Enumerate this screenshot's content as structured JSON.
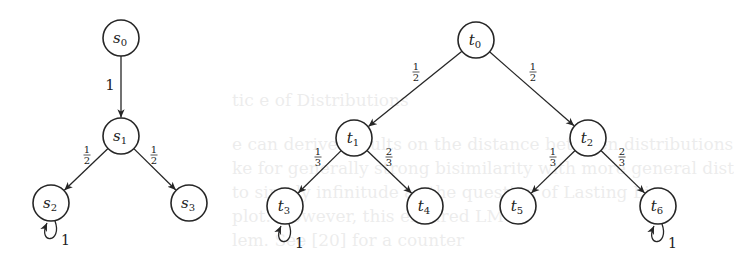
{
  "background_text": [
    {
      "text": "tic e of Distributions",
      "x": 232,
      "y": 104
    },
    {
      "text": "e can derive results on the distance between distributions",
      "x": 232,
      "y": 148
    },
    {
      "text": "ke for generally strong bisimilarity with more general dist",
      "x": 232,
      "y": 172
    },
    {
      "text": "to simply infinitude as the question of Lasting Lin",
      "x": 232,
      "y": 196
    },
    {
      "text": "plot. However, this ensured LMT",
      "x": 232,
      "y": 220
    },
    {
      "text": "lem. See [20] for a counter",
      "x": 232,
      "y": 244
    }
  ],
  "diagrams": [
    {
      "name": "s-chain",
      "nodes": [
        {
          "id": "s0",
          "label": "s",
          "sub": "0",
          "x": 121,
          "y": 38
        },
        {
          "id": "s1",
          "label": "s",
          "sub": "1",
          "x": 121,
          "y": 136
        },
        {
          "id": "s2",
          "label": "s",
          "sub": "2",
          "x": 51,
          "y": 203
        },
        {
          "id": "s3",
          "label": "s",
          "sub": "3",
          "x": 189,
          "y": 203
        }
      ],
      "edges": [
        {
          "from": "s0",
          "to": "s1",
          "label": "1",
          "num": "",
          "den": "",
          "lx": 110,
          "ly": 90
        },
        {
          "from": "s1",
          "to": "s2",
          "label": "",
          "num": "1",
          "den": "2",
          "lx": 87,
          "ly": 155
        },
        {
          "from": "s1",
          "to": "s3",
          "label": "",
          "num": "1",
          "den": "2",
          "lx": 154,
          "ly": 155
        }
      ],
      "loops": [
        {
          "node": "s2",
          "label": "1"
        }
      ]
    },
    {
      "name": "t-tree",
      "nodes": [
        {
          "id": "t0",
          "label": "t",
          "sub": "0",
          "x": 476,
          "y": 40
        },
        {
          "id": "t1",
          "label": "t",
          "sub": "1",
          "x": 354,
          "y": 138
        },
        {
          "id": "t2",
          "label": "t",
          "sub": "2",
          "x": 588,
          "y": 138
        },
        {
          "id": "t3",
          "label": "t",
          "sub": "3",
          "x": 285,
          "y": 206
        },
        {
          "id": "t4",
          "label": "t",
          "sub": "4",
          "x": 425,
          "y": 206
        },
        {
          "id": "t5",
          "label": "t",
          "sub": "5",
          "x": 518,
          "y": 206
        },
        {
          "id": "t6",
          "label": "t",
          "sub": "6",
          "x": 658,
          "y": 206
        }
      ],
      "edges": [
        {
          "from": "t0",
          "to": "t1",
          "label": "",
          "num": "1",
          "den": "2",
          "lx": 416,
          "ly": 72
        },
        {
          "from": "t0",
          "to": "t2",
          "label": "",
          "num": "1",
          "den": "2",
          "lx": 533,
          "ly": 72
        },
        {
          "from": "t1",
          "to": "t3",
          "label": "",
          "num": "1",
          "den": "3",
          "lx": 318,
          "ly": 157
        },
        {
          "from": "t1",
          "to": "t4",
          "label": "",
          "num": "2",
          "den": "3",
          "lx": 389,
          "ly": 157
        },
        {
          "from": "t2",
          "to": "t5",
          "label": "",
          "num": "1",
          "den": "3",
          "lx": 553,
          "ly": 157
        },
        {
          "from": "t2",
          "to": "t6",
          "label": "",
          "num": "2",
          "den": "3",
          "lx": 622,
          "ly": 157
        }
      ],
      "loops": [
        {
          "node": "t3",
          "label": "1"
        },
        {
          "node": "t6",
          "label": "1"
        }
      ]
    }
  ],
  "style": {
    "stroke": "#262626",
    "node_radius": 18
  }
}
